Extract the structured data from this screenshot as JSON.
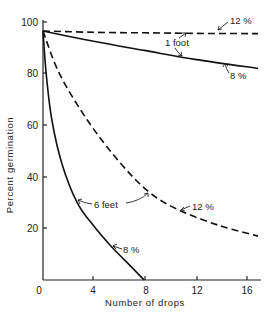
{
  "chart_data": {
    "type": "line",
    "title": "",
    "xlabel": "Number of drops",
    "ylabel": "Percent germination",
    "xlim": [
      0,
      17
    ],
    "ylim": [
      0,
      100
    ],
    "x_ticks": [
      0,
      4,
      8,
      12,
      16
    ],
    "x_tick_labels": [
      "0",
      "4",
      "8",
      "12",
      "16"
    ],
    "y_ticks": [
      20,
      40,
      60,
      80,
      100
    ],
    "y_tick_labels": [
      "20",
      "40",
      "60",
      "80",
      "100"
    ],
    "grid": false,
    "legend": null,
    "series": [
      {
        "name": "1 foot, 12%",
        "style": "dashed",
        "points": [
          [
            0,
            96.5
          ],
          [
            4,
            96
          ],
          [
            8,
            95.8
          ],
          [
            12,
            95.6
          ],
          [
            17,
            95.5
          ]
        ]
      },
      {
        "name": "1 foot, 8%",
        "style": "solid",
        "points": [
          [
            0,
            96.5
          ],
          [
            4,
            92.5
          ],
          [
            8,
            89
          ],
          [
            12,
            85.5
          ],
          [
            17,
            82
          ]
        ]
      },
      {
        "name": "6 feet, 12%",
        "style": "dashed",
        "points": [
          [
            0,
            96.5
          ],
          [
            1.3,
            80
          ],
          [
            3.5,
            62
          ],
          [
            6,
            46
          ],
          [
            8.4,
            34
          ],
          [
            10.8,
            27
          ],
          [
            14,
            21
          ],
          [
            17,
            17
          ]
        ]
      },
      {
        "name": "6 feet, 8%",
        "style": "solid",
        "points": [
          [
            0,
            96.5
          ],
          [
            0.25,
            80
          ],
          [
            0.7,
            62
          ],
          [
            1.5,
            45
          ],
          [
            2.7,
            30
          ],
          [
            4,
            21
          ],
          [
            5.4,
            13
          ],
          [
            7,
            5
          ],
          [
            8,
            0
          ]
        ]
      }
    ],
    "annotations": [
      {
        "text": "12 %",
        "target_series": "1 foot, 12%"
      },
      {
        "text": "1 foot",
        "target_series": [
          "1 foot, 12%",
          "1 foot, 8%"
        ]
      },
      {
        "text": "8 %",
        "target_series": "1 foot, 8%"
      },
      {
        "text": "6 feet",
        "target_series": [
          "6 feet, 8%",
          "6 feet, 12%"
        ]
      },
      {
        "text": "12 %",
        "target_series": "6 feet, 12%"
      },
      {
        "text": "8 %",
        "target_series": "6 feet, 8%"
      }
    ]
  },
  "labels": {
    "xlabel": "Number of drops",
    "ylabel": "Percent germination",
    "x0": "0",
    "x4": "4",
    "x8": "8",
    "x12": "12",
    "x16": "16",
    "y20": "20",
    "y40": "40",
    "y60": "60",
    "y80": "80",
    "y100": "100",
    "a_1ft_12": "12 %",
    "a_1ft": "1 foot",
    "a_1ft_8": "8 %",
    "a_6ft": "6 feet",
    "a_6ft_12": "12 %",
    "a_6ft_8": "8 %"
  }
}
